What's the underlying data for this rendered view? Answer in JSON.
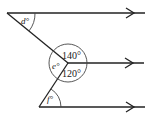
{
  "diagram": {
    "type": "geometry-parallel-lines-angles",
    "colors": {
      "line": "#222222",
      "background": "#ffffff"
    },
    "angles": {
      "d": {
        "label": "d°"
      },
      "e": {
        "label": "e°"
      },
      "f": {
        "label": "f°"
      },
      "a140": {
        "label": "140°"
      },
      "a120": {
        "label": "120°"
      }
    },
    "parallel_lines": [
      {
        "name": "top-line",
        "arrow": "right"
      },
      {
        "name": "middle-line",
        "arrow": "right"
      },
      {
        "name": "bottom-line",
        "arrow": "right"
      }
    ]
  }
}
